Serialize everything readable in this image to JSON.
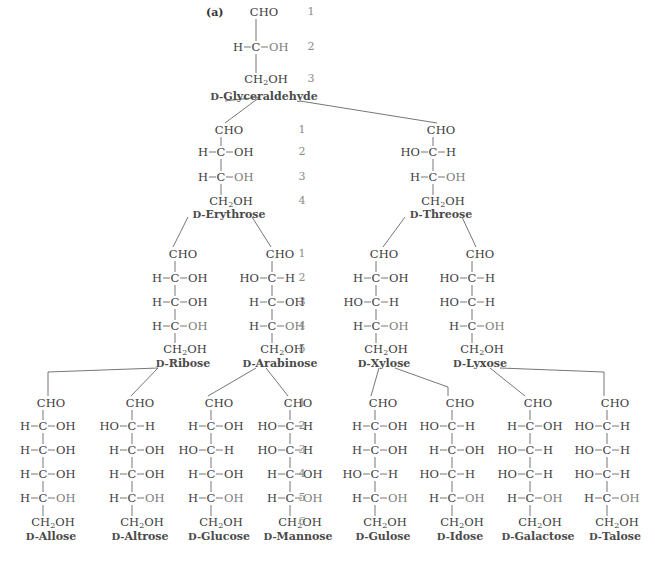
{
  "figure": {
    "panel_label": "(a)",
    "prefix": "D-",
    "bond_h": "—",
    "row_numbers": [
      "1",
      "2",
      "3",
      "4",
      "5",
      "6"
    ]
  },
  "levels": [
    {
      "level": 3,
      "carbons": 3,
      "y_cho": 12,
      "y_rows": [
        47
      ],
      "y_ch2oh": 79,
      "y_label": 97,
      "num_x": 311,
      "sugars": [
        {
          "name": "Glyceraldehyde",
          "x": 260,
          "config": [
            "R"
          ]
        }
      ]
    },
    {
      "level": 4,
      "carbons": 4,
      "y_cho": 130,
      "y_rows": [
        152,
        177
      ],
      "y_ch2oh": 201,
      "y_label": 215,
      "num_x": 302,
      "sugars": [
        {
          "name": "Erythrose",
          "x": 225,
          "config": [
            "R",
            "R"
          ]
        },
        {
          "name": "Threose",
          "x": 437,
          "config": [
            "L",
            "R"
          ]
        }
      ]
    },
    {
      "level": 5,
      "carbons": 5,
      "y_cho": 254,
      "y_rows": [
        278,
        302,
        326
      ],
      "y_ch2oh": 349,
      "y_label": 364,
      "num_x": 302,
      "sugars": [
        {
          "name": "Ribose",
          "x": 179,
          "config": [
            "R",
            "R",
            "R"
          ]
        },
        {
          "name": "Arabinose",
          "x": 276,
          "config": [
            "L",
            "R",
            "R"
          ]
        },
        {
          "name": "Xylose",
          "x": 380,
          "config": [
            "R",
            "L",
            "R"
          ]
        },
        {
          "name": "Lyxose",
          "x": 476,
          "config": [
            "L",
            "L",
            "R"
          ]
        }
      ]
    },
    {
      "level": 6,
      "carbons": 6,
      "y_cho": 403,
      "y_rows": [
        426,
        450,
        474,
        498
      ],
      "y_ch2oh": 522,
      "y_label": 537,
      "num_x": 302,
      "sugars": [
        {
          "name": "Allose",
          "x": 47,
          "config": [
            "R",
            "R",
            "R",
            "R"
          ]
        },
        {
          "name": "Altrose",
          "x": 136,
          "config": [
            "L",
            "R",
            "R",
            "R"
          ]
        },
        {
          "name": "Glucose",
          "x": 215,
          "config": [
            "R",
            "L",
            "R",
            "R"
          ]
        },
        {
          "name": "Mannose",
          "x": 294,
          "config": [
            "L",
            "L",
            "R",
            "R"
          ]
        },
        {
          "name": "Gulose",
          "x": 379,
          "config": [
            "R",
            "R",
            "L",
            "R"
          ]
        },
        {
          "name": "Idose",
          "x": 456,
          "config": [
            "L",
            "R",
            "L",
            "R"
          ]
        },
        {
          "name": "Galactose",
          "x": 534,
          "config": [
            "R",
            "L",
            "L",
            "R"
          ]
        },
        {
          "name": "Talose",
          "x": 611,
          "config": [
            "L",
            "L",
            "L",
            "R"
          ]
        }
      ]
    }
  ],
  "groups": {
    "cho": "CHO",
    "ch2oh_main": "CH",
    "ch2oh_sub": "2",
    "ch2oh_tail": "OH",
    "h": "H",
    "oh": "OH",
    "ho": "HO",
    "c": "C"
  },
  "connectors": [
    [
      [
        225,
        97
      ],
      [
        260,
        97
      ],
      [
        225,
        123
      ]
    ],
    [
      [
        300,
        97
      ],
      [
        437,
        123
      ]
    ],
    [
      [
        188,
        213
      ],
      [
        173,
        247
      ]
    ],
    [
      [
        252,
        213
      ],
      [
        271,
        247
      ]
    ],
    [
      [
        405,
        213
      ],
      [
        383,
        247
      ]
    ],
    [
      [
        462,
        213
      ],
      [
        476,
        247
      ]
    ],
    [
      [
        158,
        364
      ],
      [
        48,
        372
      ],
      [
        48,
        396
      ]
    ],
    [
      [
        158,
        364
      ],
      [
        131,
        396
      ]
    ],
    [
      [
        256,
        364
      ],
      [
        208,
        396
      ]
    ],
    [
      [
        266,
        364
      ],
      [
        288,
        396
      ]
    ],
    [
      [
        379,
        364
      ],
      [
        371,
        396
      ]
    ],
    [
      [
        395,
        364
      ],
      [
        448,
        387
      ],
      [
        448,
        396
      ]
    ],
    [
      [
        490,
        364
      ],
      [
        525,
        396
      ]
    ],
    [
      [
        500,
        364
      ],
      [
        604,
        372
      ],
      [
        604,
        396
      ]
    ]
  ]
}
